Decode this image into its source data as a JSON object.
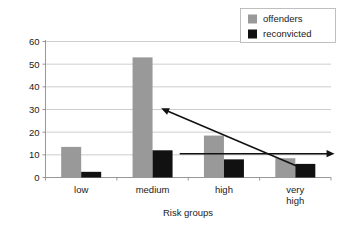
{
  "chart_data": {
    "type": "bar",
    "title": "",
    "xlabel": "Risk groups",
    "ylabel": "",
    "categories": [
      "low",
      "medium",
      "high",
      "very\nhigh"
    ],
    "category_labels": [
      {
        "line1": "low",
        "line2": ""
      },
      {
        "line1": "medium",
        "line2": ""
      },
      {
        "line1": "high",
        "line2": ""
      },
      {
        "line1": "very",
        "line2": "high"
      }
    ],
    "series": [
      {
        "name": "offenders",
        "color": "#999999",
        "values": [
          13.5,
          53,
          18.5,
          8.5
        ]
      },
      {
        "name": "reconvicted",
        "color": "#111111",
        "values": [
          2.5,
          12,
          8,
          6
        ]
      }
    ],
    "ylim": [
      0,
      60
    ],
    "yticks": [
      0,
      10,
      20,
      30,
      40,
      50,
      60
    ],
    "ytick_labels": [
      "0",
      "10",
      "20",
      "30",
      "40",
      "50",
      "60"
    ],
    "grid": true,
    "legend_position": "top-right",
    "annotations": [
      {
        "name": "declining-trend-arrow",
        "kind": "arrow",
        "direction": "up-left",
        "from_x_value": 3.25,
        "from_y_value": 2.0,
        "to_x_value": 1.12,
        "to_y_value": 30.5
      },
      {
        "name": "threshold-arrow",
        "kind": "arrow",
        "direction": "right",
        "from_x_value": 1.38,
        "from_y_value": 10.5,
        "to_x_value": 3.55,
        "to_y_value": 10.5
      }
    ]
  },
  "legend": {
    "items": [
      {
        "label": "offenders",
        "swatch": "#999999"
      },
      {
        "label": "reconvicted",
        "swatch": "#111111"
      }
    ]
  },
  "axes": {
    "x_title": "Risk groups"
  }
}
